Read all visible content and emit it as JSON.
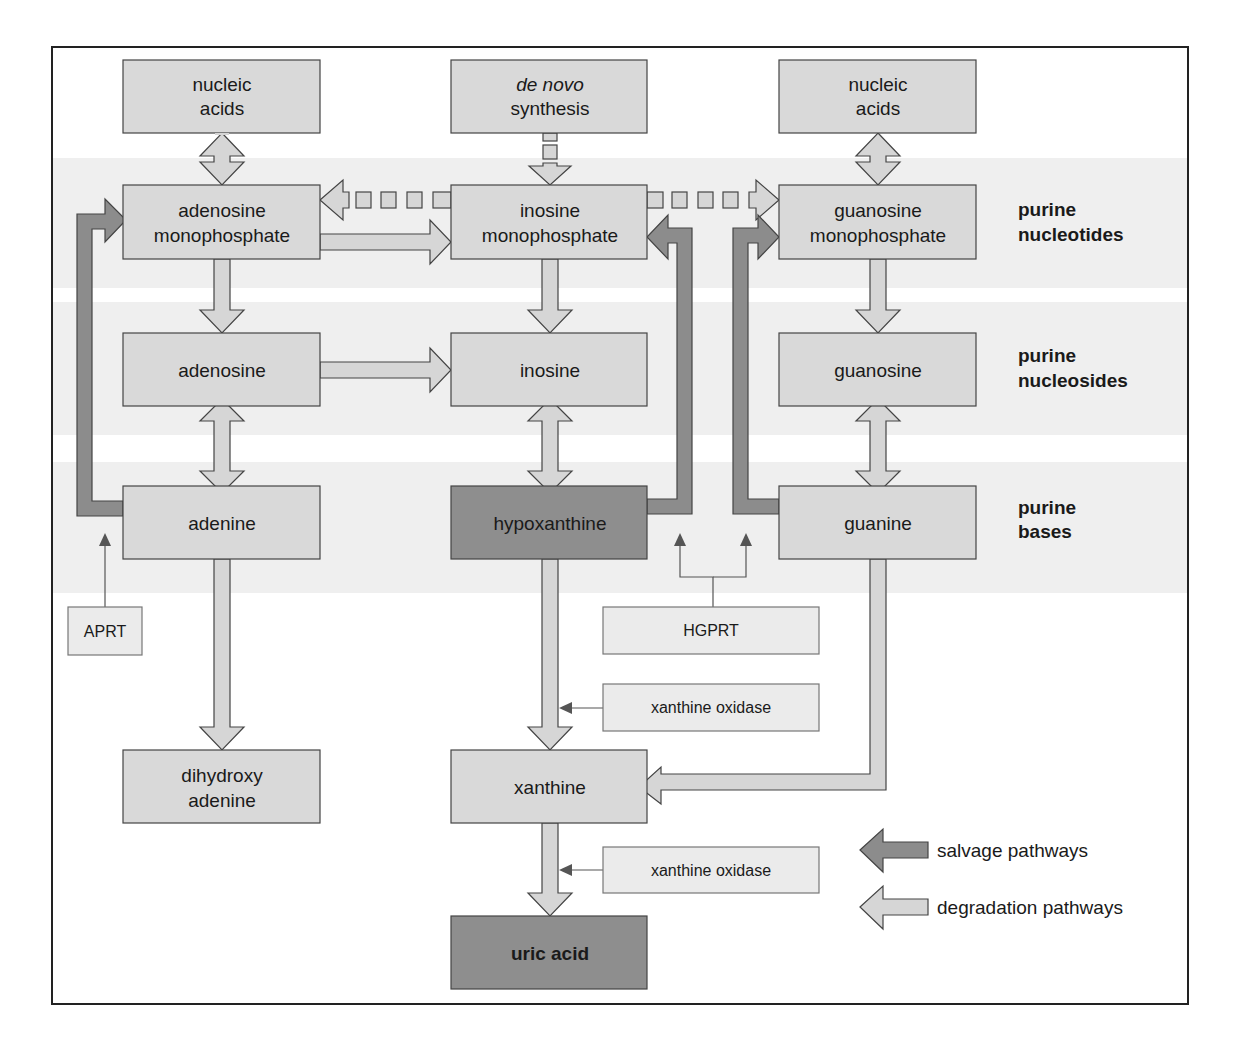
{
  "colors": {
    "frame": "#222222",
    "band": "#efefef",
    "box_fill": "#d9d9d9",
    "box_dark_fill": "#8e8e8e",
    "box_stroke": "#444444",
    "enzyme_fill": "#ebebeb",
    "enzyme_stroke": "#777777",
    "degradation_arrow": "#d6d6d6",
    "salvage_arrow": "#8c8c8c",
    "enzyme_line": "#555555"
  },
  "row_labels": [
    {
      "line1": "purine",
      "line2": "nucleotides"
    },
    {
      "line1": "purine",
      "line2": "nucleosides"
    },
    {
      "line1": "purine",
      "line2": "bases"
    }
  ],
  "boxes": {
    "nucleic_acids_left": {
      "line1": "nucleic",
      "line2": "acids"
    },
    "de_novo": {
      "line1": "de novo",
      "line2": "synthesis"
    },
    "nucleic_acids_right": {
      "line1": "nucleic",
      "line2": "acids"
    },
    "amp": {
      "line1": "adenosine",
      "line2": "monophosphate"
    },
    "imp": {
      "line1": "inosine",
      "line2": "monophosphate"
    },
    "gmp": {
      "line1": "guanosine",
      "line2": "monophosphate"
    },
    "adenosine": {
      "label": "adenosine"
    },
    "inosine": {
      "label": "inosine"
    },
    "guanosine": {
      "label": "guanosine"
    },
    "adenine": {
      "label": "adenine"
    },
    "hypoxanthine": {
      "label": "hypoxanthine"
    },
    "guanine": {
      "label": "guanine"
    },
    "dihydroxy_adenine": {
      "line1": "dihydroxy",
      "line2": "adenine"
    },
    "xanthine": {
      "label": "xanthine"
    },
    "uric_acid": {
      "label": "uric acid"
    }
  },
  "enzymes": {
    "aprt": "APRT",
    "hgprt": "HGPRT",
    "xanthine_oxidase_1": "xanthine oxidase",
    "xanthine_oxidase_2": "xanthine oxidase"
  },
  "legend": {
    "salvage": "salvage pathways",
    "degradation": "degradation pathways"
  }
}
